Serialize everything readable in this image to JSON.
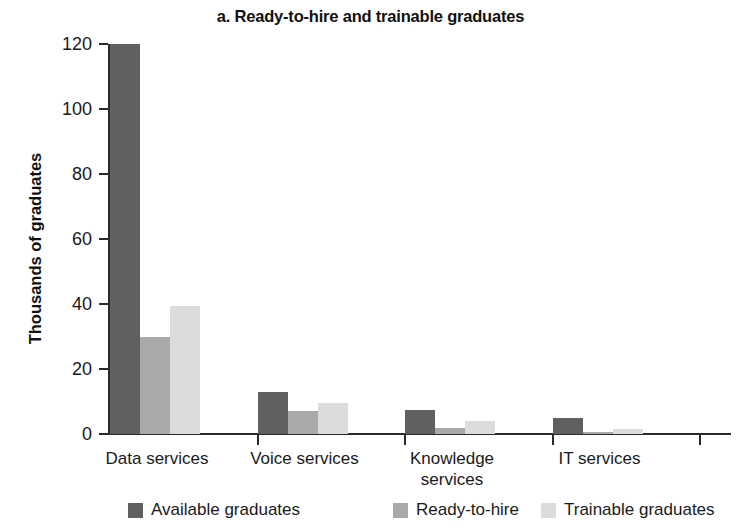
{
  "chart_data": {
    "type": "bar",
    "title": "a. Ready-to-hire and trainable graduates",
    "xlabel": "",
    "ylabel": "Thousands of graduates",
    "ylim": [
      0,
      120
    ],
    "yticks": [
      0,
      20,
      40,
      60,
      80,
      100,
      120
    ],
    "ytick_labels": [
      "0",
      "20",
      "40",
      "60",
      "80",
      "100",
      "120"
    ],
    "grid": false,
    "legend_position": "bottom",
    "categories": [
      "Data services",
      "Voice services",
      "Knowledge services",
      "IT services"
    ],
    "category_lines": [
      [
        "Data services"
      ],
      [
        "Voice services"
      ],
      [
        "Knowledge",
        "services"
      ],
      [
        "IT services"
      ]
    ],
    "series": [
      {
        "name": "Available graduates",
        "color": "#606060",
        "values": [
          120,
          13,
          7.5,
          5
        ]
      },
      {
        "name": "Ready-to-hire",
        "color": "#a9a9a9",
        "values": [
          30,
          7,
          2,
          0.5
        ]
      },
      {
        "name": "Trainable graduates",
        "color": "#dcdcdc",
        "values": [
          39.5,
          9.5,
          4,
          1.5
        ]
      }
    ]
  },
  "axis": {
    "color": "#2b2b2b"
  }
}
